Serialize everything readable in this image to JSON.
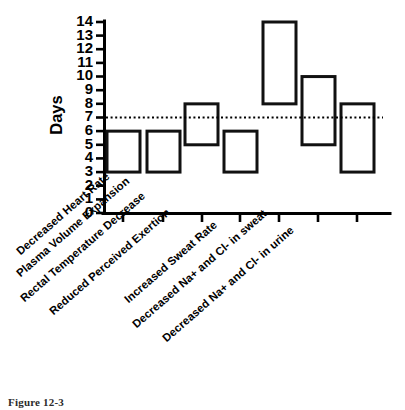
{
  "figure": {
    "caption": "Figure 12-3"
  },
  "chart_data": {
    "type": "bar",
    "chart_subtype": "floating-range-bar",
    "title": "",
    "xlabel": "",
    "ylabel": "Days",
    "ylim": [
      0,
      14
    ],
    "yticks": [
      0,
      1,
      2,
      3,
      4,
      5,
      6,
      7,
      8,
      9,
      10,
      11,
      12,
      13,
      14
    ],
    "ytick_labels": [
      "0",
      "1",
      "2",
      "3",
      "4",
      "5",
      "6",
      "7",
      "8",
      "9",
      "10",
      "11",
      "12",
      "13",
      "14"
    ],
    "grid": false,
    "legend": "none",
    "reference_line": {
      "label": "",
      "value": 7,
      "style": "dotted"
    },
    "categories": [
      "Decreased Heart Rate",
      "Plasma Volume Expansion",
      "Rectal Temperature Decrease",
      "Reduced Perceived Exertion",
      "Increased Sweat Rate",
      "Decreased Na+ and Cl- in sweat",
      "Decreased Na+ and Cl- in urine"
    ],
    "series": [
      {
        "name": "Adaptation time range (days)",
        "ranges": [
          {
            "low": 3,
            "high": 6
          },
          {
            "low": 3,
            "high": 6
          },
          {
            "low": 5,
            "high": 8
          },
          {
            "low": 3,
            "high": 6
          },
          {
            "low": 8,
            "high": 14
          },
          {
            "low": 5,
            "high": 10
          },
          {
            "low": 3,
            "high": 8
          }
        ]
      }
    ]
  }
}
